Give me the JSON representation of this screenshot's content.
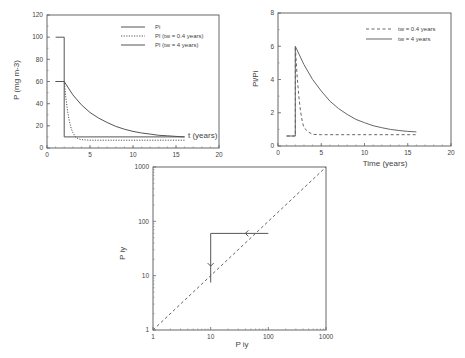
{
  "chart_data": [
    {
      "id": "chart1",
      "type": "line",
      "title": "",
      "xlabel": "t (years)",
      "ylabel": "P (mg m-3)",
      "xlim": [
        0,
        20
      ],
      "ylim": [
        0,
        120
      ],
      "xticks": [
        0,
        5,
        10,
        15,
        20
      ],
      "yticks": [
        0,
        20,
        40,
        60,
        80,
        100,
        120
      ],
      "grid": false,
      "legend_position": "upper right",
      "series": [
        {
          "name": "Pi",
          "style": "solid",
          "color": "#555555",
          "x": [
            1,
            2,
            2,
            16
          ],
          "y": [
            100,
            100,
            10,
            10
          ]
        },
        {
          "name": "Pl (tw = 0.4 years)",
          "style": "dotted",
          "color": "#555555",
          "x": [
            1,
            2,
            2.2,
            2.4,
            2.6,
            2.8,
            3,
            3.3,
            3.6,
            4,
            5,
            16
          ],
          "y": [
            60,
            60,
            45,
            33,
            24,
            18,
            14,
            10,
            8.5,
            7.5,
            7,
            7
          ]
        },
        {
          "name": "Pl (tw = 4 years)",
          "style": "solid",
          "color": "#555555",
          "x": [
            1,
            2,
            3,
            4,
            5,
            6,
            7,
            8,
            9,
            10,
            11,
            12,
            13,
            14,
            15,
            16
          ],
          "y": [
            60,
            60,
            48,
            39,
            32,
            27,
            23,
            19.5,
            17,
            15,
            13.5,
            12.5,
            11.5,
            11,
            10.5,
            10
          ]
        }
      ],
      "box": {
        "left": 47,
        "top": 15,
        "right": 219,
        "bottom": 148
      }
    },
    {
      "id": "chart2",
      "type": "line",
      "title": "",
      "xlabel": "Time (years)",
      "ylabel": "Pl/Pi",
      "xlim": [
        0,
        20
      ],
      "ylim": [
        0,
        8
      ],
      "xticks": [
        0,
        5,
        10,
        15,
        20
      ],
      "yticks": [
        0,
        2,
        4,
        6,
        8
      ],
      "grid": false,
      "legend_position": "upper right",
      "series": [
        {
          "name": "tw = 0.4 years",
          "style": "dashed",
          "color": "#666666",
          "x": [
            1,
            2,
            2,
            2.2,
            2.4,
            2.6,
            2.8,
            3,
            3.5,
            4,
            5,
            16
          ],
          "y": [
            0.6,
            0.6,
            6,
            4.3,
            3.0,
            2.1,
            1.5,
            1.1,
            0.85,
            0.7,
            0.68,
            0.68
          ]
        },
        {
          "name": "tw = 4 years",
          "style": "solid",
          "color": "#666666",
          "x": [
            1,
            2,
            2,
            3,
            4,
            5,
            6,
            7,
            8,
            9,
            10,
            11,
            12,
            13,
            14,
            15,
            16
          ],
          "y": [
            0.6,
            0.6,
            6,
            4.9,
            4.0,
            3.3,
            2.7,
            2.25,
            1.9,
            1.6,
            1.4,
            1.22,
            1.1,
            1.0,
            0.93,
            0.88,
            0.85
          ]
        }
      ],
      "box": {
        "left": 278,
        "top": 13,
        "right": 451,
        "bottom": 146
      }
    },
    {
      "id": "chart3",
      "type": "line",
      "title": "",
      "xlabel": "P iy",
      "ylabel": "P iy",
      "xscale": "log",
      "yscale": "log",
      "xlim": [
        1,
        1000
      ],
      "ylim": [
        1,
        1000
      ],
      "xticks": [
        1,
        10,
        100,
        1000
      ],
      "yticks": [
        1,
        10,
        100,
        1000
      ],
      "grid": false,
      "series": [
        {
          "name": "1:1 line",
          "style": "dashed",
          "color": "#666666",
          "x": [
            1,
            1000
          ],
          "y": [
            1,
            1000
          ]
        },
        {
          "name": "trajectory",
          "style": "solid",
          "color": "#555555",
          "x": [
            100,
            10,
            10
          ],
          "y": [
            60,
            60,
            7.5
          ]
        }
      ],
      "annotations": [
        {
          "type": "arrow",
          "direction": "left",
          "x": 40,
          "y": 60
        },
        {
          "type": "arrow",
          "direction": "down",
          "x": 10,
          "y": 15
        }
      ],
      "box": {
        "left": 153,
        "top": 167,
        "right": 326,
        "bottom": 330
      }
    }
  ]
}
